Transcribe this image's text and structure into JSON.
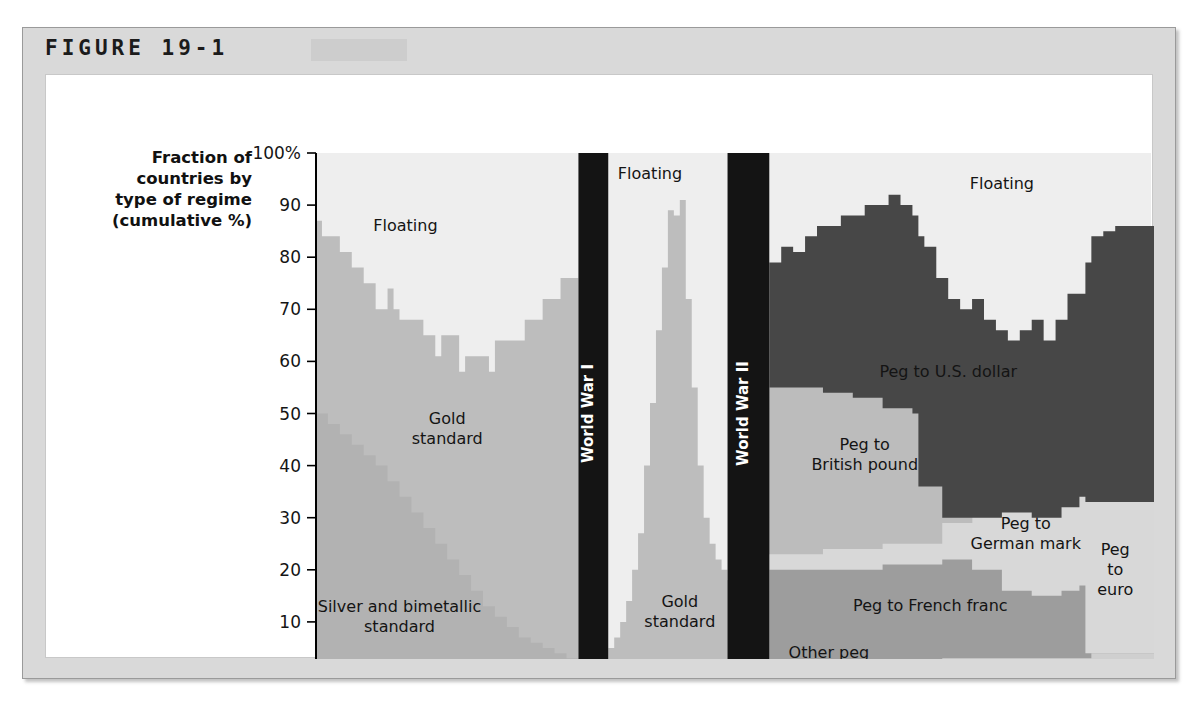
{
  "figure": {
    "label": "FIGURE 19-1",
    "axis_title_lines": [
      "Fraction of",
      "countries by",
      "type of regime",
      "(cumulative %)"
    ]
  },
  "chart_data": {
    "type": "area",
    "title": "FIGURE 19-1",
    "ylabel": "Fraction of countries by type of regime (cumulative %)",
    "xlabel": "",
    "ylim": [
      0,
      100
    ],
    "xlim": [
      1870,
      2010
    ],
    "grid": false,
    "legend_position": "in-plot annotations",
    "ytick_labels": [
      "100%",
      "90",
      "80",
      "70",
      "60",
      "50",
      "40",
      "30",
      "20",
      "10",
      "0"
    ],
    "ytick_values": [
      100,
      90,
      80,
      70,
      60,
      50,
      40,
      30,
      20,
      10,
      0
    ],
    "xtick_labels": [
      "1870",
      "1880",
      "1890",
      "1900",
      "1910",
      "1920",
      "1930",
      "1940",
      "1950",
      "1960",
      "1970",
      "1980",
      "1990",
      "2000",
      "2010"
    ],
    "xtick_values": [
      1870,
      1880,
      1890,
      1900,
      1910,
      1920,
      1930,
      1940,
      1950,
      1960,
      1970,
      1980,
      1990,
      2000,
      2010
    ],
    "annotations": [
      {
        "text": "Floating",
        "x": 1885,
        "y": 85,
        "name": "floating-early"
      },
      {
        "text": "Gold standard",
        "x": 1892,
        "y": 46,
        "name": "gold-standard-early"
      },
      {
        "text": "Silver and bimetallic standard",
        "x": 1884,
        "y": 10,
        "name": "silver-bimetallic"
      },
      {
        "text": "Floating",
        "x": 1926,
        "y": 95,
        "name": "floating-interwar"
      },
      {
        "text": "Gold standard",
        "x": 1931,
        "y": 11,
        "name": "gold-standard-interwar"
      },
      {
        "text": "Floating",
        "x": 1985,
        "y": 93,
        "name": "floating-modern"
      },
      {
        "text": "Peg to U.S. dollar",
        "x": 1976,
        "y": 57,
        "name": "peg-us-dollar"
      },
      {
        "text": "Peg to British pound",
        "x": 1962,
        "y": 41,
        "name": "peg-british-pound"
      },
      {
        "text": "Peg to German mark",
        "x": 1989,
        "y": 26,
        "name": "peg-german-mark"
      },
      {
        "text": "Peg to French franc",
        "x": 1973,
        "y": 12,
        "name": "peg-french-franc"
      },
      {
        "text": "Other peg",
        "x": 1956,
        "y": 3,
        "name": "other-peg"
      },
      {
        "text": "Peg to euro",
        "x": 2004,
        "y": 19,
        "name": "peg-euro"
      }
    ],
    "war_bands": [
      {
        "label": "World War I",
        "start": 1914,
        "end": 1919,
        "color": "#141414"
      },
      {
        "label": "World War II",
        "start": 1939,
        "end": 1946,
        "color": "#141414"
      }
    ],
    "colors": {
      "floating": "#eeeeee",
      "gold_standard": "#bdbdbd",
      "silver_bimetallic": "#b2b2b2",
      "peg_us_dollar": "#474747",
      "peg_british_pound": "#bcbcbc",
      "peg_german_mark": "#d8d8d8",
      "peg_french_franc": "#9d9d9d",
      "other_peg": "#cfcfcf",
      "peg_euro": "#dcdcdc",
      "war_band": "#141414",
      "frame": "#d9d9d9",
      "plot_bg": "#ffffff"
    },
    "series": [
      {
        "name": "Silver and bimetallic standard",
        "color_key": "silver_bimetallic",
        "era": "pre-WWI",
        "x": [
          1870,
          1872,
          1874,
          1876,
          1878,
          1880,
          1882,
          1884,
          1886,
          1888,
          1890,
          1892,
          1894,
          1896,
          1898,
          1900,
          1902,
          1904,
          1906,
          1908,
          1910,
          1912,
          1913
        ],
        "values": [
          50,
          48,
          46,
          44,
          42,
          40,
          37,
          34,
          31,
          28,
          25,
          22,
          19,
          16,
          13,
          11,
          9,
          7,
          6,
          5,
          4,
          3,
          3
        ]
      },
      {
        "name": "Gold standard",
        "color_key": "gold_standard",
        "era": "pre-WWI cumulative top",
        "x": [
          1870,
          1871,
          1872,
          1873,
          1874,
          1875,
          1876,
          1877,
          1878,
          1879,
          1880,
          1881,
          1882,
          1883,
          1884,
          1885,
          1886,
          1887,
          1888,
          1889,
          1890,
          1891,
          1892,
          1893,
          1894,
          1895,
          1896,
          1897,
          1898,
          1899,
          1900,
          1901,
          1902,
          1903,
          1904,
          1905,
          1906,
          1907,
          1908,
          1909,
          1910,
          1911,
          1912,
          1913
        ],
        "values": [
          87,
          84,
          84,
          84,
          81,
          81,
          78,
          78,
          75,
          75,
          70,
          70,
          74,
          70,
          68,
          68,
          68,
          68,
          65,
          65,
          61,
          65,
          65,
          65,
          58,
          61,
          61,
          61,
          61,
          58,
          64,
          64,
          64,
          64,
          64,
          68,
          68,
          68,
          72,
          72,
          72,
          76,
          76,
          76
        ]
      },
      {
        "name": "Gold standard",
        "color_key": "gold_standard",
        "era": "interwar cumulative top",
        "x": [
          1919,
          1920,
          1921,
          1922,
          1923,
          1924,
          1925,
          1926,
          1927,
          1928,
          1929,
          1930,
          1931,
          1932,
          1933,
          1934,
          1935,
          1936,
          1937,
          1938,
          1939
        ],
        "values": [
          5,
          7,
          10,
          14,
          20,
          27,
          40,
          52,
          66,
          78,
          89,
          88,
          91,
          72,
          55,
          40,
          30,
          25,
          22,
          20,
          18
        ]
      },
      {
        "name": "Other peg",
        "color_key": "other_peg",
        "era": "post-WWII",
        "x": [
          1946,
          1950,
          1955,
          1960,
          1965,
          1970,
          1975,
          1980,
          1985,
          1990,
          1995,
          1999,
          2000,
          2005,
          2010
        ],
        "values": [
          2,
          2,
          2,
          2,
          2,
          2,
          3,
          3,
          3,
          3,
          3,
          3,
          4,
          4,
          4
        ]
      },
      {
        "name": "Peg to French franc",
        "color_key": "peg_french_franc",
        "era": "post-WWII cumulative",
        "x": [
          1946,
          1950,
          1955,
          1960,
          1965,
          1970,
          1975,
          1980,
          1985,
          1990,
          1995,
          1998,
          1999,
          2000,
          2005,
          2010
        ],
        "values": [
          20,
          20,
          20,
          20,
          21,
          21,
          22,
          20,
          16,
          15,
          16,
          17,
          4,
          4,
          4,
          4
        ]
      },
      {
        "name": "Peg to German mark",
        "color_key": "peg_german_mark",
        "era": "post-WWII cumulative",
        "x": [
          1946,
          1950,
          1955,
          1960,
          1965,
          1970,
          1975,
          1980,
          1985,
          1990,
          1995,
          1998,
          1999,
          2000,
          2005,
          2010
        ],
        "values": [
          23,
          23,
          24,
          24,
          25,
          25,
          29,
          30,
          31,
          30,
          32,
          34,
          33,
          33,
          33,
          33
        ]
      },
      {
        "name": "Peg to British pound",
        "color_key": "peg_british_pound",
        "era": "post-WWII cumulative",
        "x": [
          1946,
          1950,
          1955,
          1960,
          1965,
          1970,
          1971,
          1975,
          1980
        ],
        "values": [
          55,
          55,
          54,
          53,
          51,
          50,
          36,
          30,
          29
        ]
      },
      {
        "name": "Peg to U.S. dollar",
        "color_key": "peg_us_dollar",
        "era": "post-WWII cumulative top",
        "x": [
          1946,
          1948,
          1950,
          1952,
          1954,
          1956,
          1958,
          1960,
          1962,
          1964,
          1966,
          1968,
          1970,
          1971,
          1972,
          1974,
          1976,
          1978,
          1980,
          1982,
          1984,
          1986,
          1988,
          1990,
          1992,
          1994,
          1996,
          1998,
          1999,
          2000,
          2002,
          2004,
          2006,
          2008,
          2010
        ],
        "values": [
          79,
          82,
          81,
          84,
          86,
          86,
          88,
          88,
          90,
          90,
          92,
          90,
          88,
          84,
          82,
          76,
          72,
          70,
          72,
          68,
          66,
          64,
          66,
          68,
          64,
          68,
          73,
          73,
          79,
          84,
          85,
          86,
          86,
          86,
          86
        ]
      },
      {
        "name": "Peg to euro",
        "color_key": "peg_euro",
        "era": "post-1999 cumulative",
        "x": [
          1999,
          2000,
          2002,
          2004,
          2006,
          2008,
          2010
        ],
        "values": [
          33,
          33,
          33,
          33,
          33,
          33,
          33
        ]
      },
      {
        "name": "Floating",
        "color_key": "floating",
        "era": "remainder to 100%",
        "note": "Region above the topmost stacked series up to 100%"
      }
    ]
  }
}
